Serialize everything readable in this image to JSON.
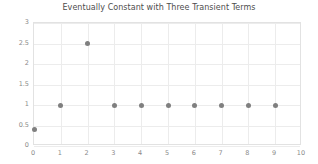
{
  "chart_data": {
    "type": "scatter",
    "title": "Eventually Constant with Three Transient Terms",
    "xlabel": "",
    "ylabel": "",
    "x": [
      0,
      1,
      2,
      3,
      4,
      5,
      6,
      7,
      8,
      9
    ],
    "values": [
      0.4,
      1,
      2.5,
      1,
      1,
      1,
      1,
      1,
      1,
      1
    ],
    "series": [
      {
        "name": "sequence",
        "x": [
          0,
          1,
          2,
          3,
          4,
          5,
          6,
          7,
          8,
          9
        ],
        "values": [
          0.4,
          1,
          2.5,
          1,
          1,
          1,
          1,
          1,
          1,
          1
        ]
      }
    ],
    "xlim": [
      0,
      10
    ],
    "ylim": [
      0,
      3
    ],
    "xticks": [
      0,
      1,
      2,
      3,
      4,
      5,
      6,
      7,
      8,
      9,
      10
    ],
    "xtick_labels": [
      "0",
      "1",
      "2",
      "3",
      "4",
      "5",
      "6",
      "7",
      "8",
      "9",
      "10"
    ],
    "yticks": [
      0,
      0.5,
      1,
      1.5,
      2,
      2.5,
      3
    ],
    "ytick_labels": [
      "0",
      "0.5",
      "1",
      "1.5",
      "2",
      "2.5",
      "3"
    ],
    "grid": true,
    "legend": false,
    "marker_color": "#7f7f7f",
    "grid_color": "#ececec",
    "axis_color": "#e2e2e2",
    "tick_label_color": "#8a8a8a",
    "title_color": "#4d4d4d",
    "background_color": "#ffffff"
  }
}
